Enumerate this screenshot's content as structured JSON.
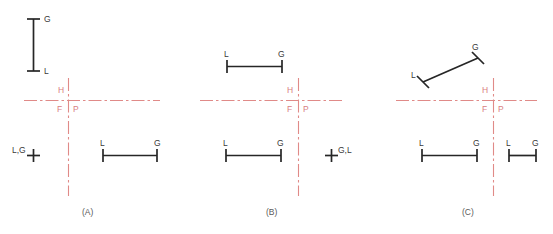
{
  "figure": {
    "title": "",
    "background_color": "#ffffff",
    "black_color": "#262626",
    "red_color": "#e08a88",
    "label_color": "#3a3a3a",
    "caption_color": "#5a5a5a"
  },
  "panels": [
    {
      "id": "A",
      "caption": "(A)",
      "axis": {
        "horizontal_label_left": "H",
        "label_below_left": "F",
        "label_below_right": "P"
      },
      "features": [
        {
          "name": "vertical-bar-upper-left",
          "endpoint_labels": [
            "G",
            "L"
          ],
          "orientation": "vertical"
        },
        {
          "name": "point-marker-left",
          "endpoint_labels": [
            "L,G"
          ],
          "orientation": "point"
        },
        {
          "name": "horizontal-bar-lower-right",
          "endpoint_labels": [
            "L",
            "G"
          ],
          "orientation": "horizontal"
        }
      ]
    },
    {
      "id": "B",
      "caption": "(B)",
      "axis": {
        "horizontal_label_left": "H",
        "label_below_left": "F",
        "label_below_right": "P"
      },
      "features": [
        {
          "name": "horizontal-bar-upper-left",
          "endpoint_labels": [
            "L",
            "G"
          ],
          "orientation": "horizontal"
        },
        {
          "name": "horizontal-bar-lower-left",
          "endpoint_labels": [
            "L",
            "G"
          ],
          "orientation": "horizontal"
        },
        {
          "name": "point-marker-lower-right",
          "endpoint_labels": [
            "G,L"
          ],
          "orientation": "point"
        }
      ]
    },
    {
      "id": "C",
      "caption": "(C)",
      "axis": {
        "horizontal_label_left": "H",
        "label_below_left": "F",
        "label_below_right": "P"
      },
      "features": [
        {
          "name": "diagonal-bar-upper-left",
          "endpoint_labels": [
            "L",
            "G"
          ],
          "orientation": "diagonal"
        },
        {
          "name": "horizontal-bar-lower-left",
          "endpoint_labels": [
            "L",
            "G"
          ],
          "orientation": "horizontal"
        },
        {
          "name": "horizontal-bar-lower-right",
          "endpoint_labels": [
            "L",
            "G"
          ],
          "orientation": "horizontal"
        }
      ]
    }
  ],
  "labels": {
    "G": "G",
    "L": "L",
    "H": "H",
    "F": "F",
    "P": "P",
    "LG_comma": "L,G",
    "GL_comma": "G,L",
    "caption_a": "(A)",
    "caption_b": "(B)",
    "caption_c": "(C)"
  }
}
